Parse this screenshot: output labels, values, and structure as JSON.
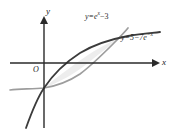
{
  "figure": {
    "kind": "math-graph",
    "width": 177,
    "height": 135,
    "background": "#ffffff"
  },
  "axes": {
    "y_label": "y",
    "x_label": "x",
    "origin_label": "O",
    "axis_color": "#2a2a2a",
    "x_axis": {
      "y_px": 63,
      "x_start_px": 10,
      "x_end_px": 157
    },
    "y_axis": {
      "x_px": 44,
      "y_start_px": 17,
      "y_end_px": 128
    }
  },
  "curves": [
    {
      "id": "curve-exp-minus-3",
      "label_prefix": "y=e",
      "label_exponent": "x",
      "label_suffix": "−3",
      "equation": "y = e^x - 3",
      "color": "#9a9a9a",
      "width": 1.6,
      "shape": "concave-up increasing"
    },
    {
      "id": "curve-5-minus-7exp",
      "label_prefix": "y=5−7e",
      "label_exponent": "−x",
      "label_suffix": "",
      "equation": "y = 5 - 7e^{-x}",
      "color": "#3a3a3a",
      "width": 1.8,
      "shape": "concave-down increasing"
    }
  ],
  "shaded_region": {
    "name": "area-between-curves",
    "fill": "#eeeeee",
    "description": "region bounded by the two curves between their intersections"
  }
}
